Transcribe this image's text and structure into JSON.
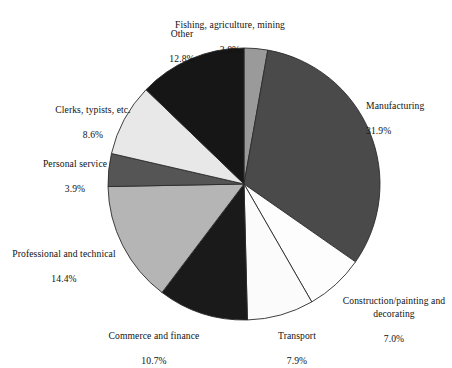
{
  "chart_data": {
    "type": "pie",
    "title": "",
    "subtitle": "",
    "xlabel": "",
    "ylabel": "",
    "legend_position": "none",
    "grid": false,
    "units": "percent",
    "start_angle_deg": 0,
    "direction": "clockwise",
    "categories": [
      "Fishing, agriculture, mining",
      "Manufacturing",
      "Construction/painting and decorating",
      "Transport",
      "Commerce and finance",
      "Professional and technical",
      "Personal service",
      "Clerks, typists, etc.",
      "Other"
    ],
    "values": [
      2.8,
      31.9,
      7.0,
      7.9,
      10.7,
      14.4,
      3.9,
      8.6,
      12.8
    ],
    "value_labels": [
      "2.8%",
      "31.9%",
      "7.0%",
      "7.9%",
      "10.7%",
      "14.4%",
      "3.9%",
      "8.6%",
      "12.8%"
    ],
    "colors": [
      "#9a9a9a",
      "#4a4a4a",
      "#fdfdfd",
      "#fbfbfb",
      "#1a1a1a",
      "#b5b5b5",
      "#555555",
      "#e8e8e8",
      "#161616"
    ],
    "slice_outline_color": "#2b2b2b",
    "slices": [
      {
        "label": "Fishing, agriculture, mining",
        "value": 2.8,
        "value_label": "2.8%",
        "color": "#9a9a9a"
      },
      {
        "label": "Manufacturing",
        "value": 31.9,
        "value_label": "31.9%",
        "color": "#4a4a4a"
      },
      {
        "label": "Construction/painting and decorating",
        "value": 7.0,
        "value_label": "7.0%",
        "color": "#fdfdfd"
      },
      {
        "label": "Transport",
        "value": 7.9,
        "value_label": "7.9%",
        "color": "#fbfbfb"
      },
      {
        "label": "Commerce and finance",
        "value": 10.7,
        "value_label": "10.7%",
        "color": "#1a1a1a"
      },
      {
        "label": "Professional and technical",
        "value": 14.4,
        "value_label": "14.4%",
        "color": "#b5b5b5"
      },
      {
        "label": "Personal service",
        "value": 3.9,
        "value_label": "3.9%",
        "color": "#555555"
      },
      {
        "label": "Clerks, typists, etc.",
        "value": 8.6,
        "value_label": "8.6%",
        "color": "#e8e8e8"
      },
      {
        "label": "Other",
        "value": 12.8,
        "value_label": "12.8%",
        "color": "#161616"
      }
    ]
  },
  "labels": {
    "fishing": {
      "name": "Fishing, agriculture, mining",
      "value": "2.8%"
    },
    "manufacturing": {
      "name": "Manufacturing",
      "value": "31.9%"
    },
    "construction": {
      "name": "Construction/painting and\ndecorating",
      "value": "7.0%"
    },
    "transport": {
      "name": "Transport",
      "value": "7.9%"
    },
    "commerce": {
      "name": "Commerce and finance",
      "value": "10.7%"
    },
    "professional": {
      "name": "Professional and technical",
      "value": "14.4%"
    },
    "personal": {
      "name": "Personal service",
      "value": "3.9%"
    },
    "clerks": {
      "name": "Clerks, typists, etc.",
      "value": "8.6%"
    },
    "other": {
      "name": "Other",
      "value": "12.8%"
    }
  }
}
